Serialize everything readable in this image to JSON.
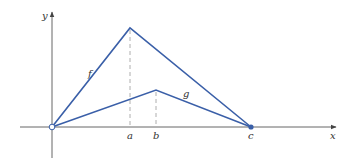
{
  "figure": {
    "axes": {
      "x_label": "x",
      "y_label": "y",
      "axis_color": "#555555"
    },
    "curves": [
      {
        "name": "f",
        "label": "f",
        "color": "#3a5fa8",
        "points": [
          "origin",
          "a",
          "c"
        ],
        "peak_at": "a"
      },
      {
        "name": "g",
        "label": "g",
        "color": "#3a5fa8",
        "points": [
          "origin",
          "b",
          "c"
        ],
        "peak_at": "b"
      }
    ],
    "x_ticks": [
      {
        "label": "a"
      },
      {
        "label": "b"
      },
      {
        "label": "c"
      }
    ],
    "markers": {
      "origin": "open-circle",
      "c": "filled-circle"
    },
    "guide_lines": "dashed vertical lines from peaks to x-axis at a and b"
  }
}
